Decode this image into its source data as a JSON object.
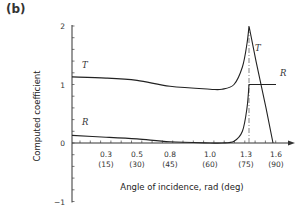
{
  "panel_label": "(b)",
  "chart_data": {
    "type": "line",
    "title": "",
    "xlabel": "Angle of incidence, rad (deg)",
    "ylabel": "Computed coefficient",
    "ylim": [
      -1,
      2
    ],
    "xlim": [
      0,
      1.65
    ],
    "grid": false,
    "legend": "inline labels",
    "y_ticks": [
      "2",
      "1",
      "0",
      "−1"
    ],
    "x_ticks": [
      {
        "rad": "0.3",
        "deg": "(15)"
      },
      {
        "rad": "0.5",
        "deg": "(30)"
      },
      {
        "rad": "0.8",
        "deg": "(45)"
      },
      {
        "rad": "1.0",
        "deg": "(60)"
      },
      {
        "rad": "1.3",
        "deg": "(75)"
      },
      {
        "rad": "1.6",
        "deg": "(90)"
      }
    ],
    "series": [
      {
        "name": "T",
        "x": [
          0,
          0.3,
          0.5,
          0.8,
          1.0,
          1.1,
          1.2,
          1.27,
          1.31,
          1.33,
          1.4,
          1.5,
          1.57
        ],
        "values": [
          1.13,
          1.11,
          1.07,
          0.97,
          0.92,
          0.92,
          1.0,
          1.3,
          1.7,
          2.0,
          1.4,
          0.6,
          0.0
        ]
      },
      {
        "name": "R",
        "x": [
          0,
          0.3,
          0.5,
          0.8,
          1.0,
          1.1,
          1.2,
          1.27,
          1.31,
          1.33,
          1.45,
          1.6
        ],
        "values": [
          0.13,
          0.1,
          0.07,
          0.02,
          0.0,
          0.0,
          0.03,
          0.2,
          0.6,
          1.0,
          1.0,
          1.0
        ]
      }
    ],
    "annotations": [
      {
        "type": "dash-dot vertical line",
        "x": 1.33,
        "from": 0,
        "to": 1.9
      }
    ]
  }
}
